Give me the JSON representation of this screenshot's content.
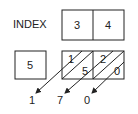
{
  "diagram": {
    "title_label": "INDEX",
    "multiplicand_digits": [
      "3",
      "4"
    ],
    "multiplier": "5",
    "lattice_cells": [
      {
        "tens": "1",
        "ones": "5"
      },
      {
        "tens": "2",
        "ones": "0"
      }
    ],
    "result_digits": [
      "1",
      "7",
      "0"
    ],
    "colors": {
      "stroke": "#222222",
      "background": "#ffffff"
    }
  }
}
